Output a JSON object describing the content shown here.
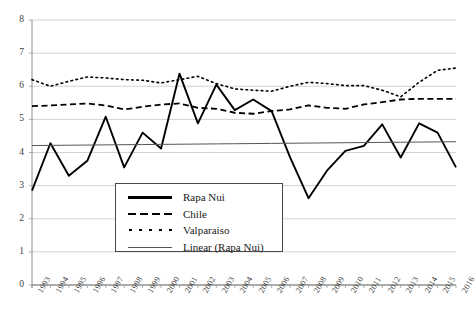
{
  "chart_data": {
    "type": "line",
    "title": "",
    "xlabel": "",
    "ylabel": "",
    "ylim": [
      0,
      8
    ],
    "ytick_step": 1,
    "grid": "horizontal",
    "legend_position": "lower-center-left",
    "categories": [
      "1993",
      "1994",
      "1995",
      "1996",
      "1997",
      "1998",
      "1999",
      "2000",
      "2001",
      "2002",
      "2003",
      "2004",
      "2005",
      "2006",
      "2007",
      "2008",
      "2009",
      "2010",
      "2011",
      "2012",
      "2013",
      "2014",
      "2015",
      "2016"
    ],
    "yticks": [
      "0",
      "1",
      "2",
      "3",
      "4",
      "5",
      "6",
      "7",
      "8"
    ],
    "series": [
      {
        "name": "Rapa Nui",
        "style": "solid",
        "color": "#000000",
        "width": 1.9,
        "values": [
          2.85,
          4.28,
          3.3,
          3.75,
          5.08,
          3.55,
          4.6,
          4.12,
          6.38,
          4.88,
          6.05,
          5.28,
          5.6,
          5.25,
          3.85,
          2.62,
          3.45,
          4.05,
          4.2,
          4.85,
          3.85,
          4.88,
          4.6,
          3.55
        ]
      },
      {
        "name": "Chile",
        "style": "dashed",
        "color": "#000000",
        "width": 1.8,
        "values": [
          5.4,
          5.42,
          5.45,
          5.48,
          5.42,
          5.3,
          5.38,
          5.45,
          5.48,
          5.35,
          5.32,
          5.2,
          5.17,
          5.25,
          5.3,
          5.42,
          5.35,
          5.32,
          5.45,
          5.52,
          5.6,
          5.62,
          5.62,
          5.62
        ]
      },
      {
        "name": "Valparaiso",
        "style": "dotted",
        "color": "#000000",
        "width": 1.6,
        "values": [
          6.2,
          6.0,
          6.15,
          6.28,
          6.25,
          6.2,
          6.18,
          6.1,
          6.2,
          6.3,
          6.08,
          5.92,
          5.88,
          5.85,
          6.0,
          6.12,
          6.08,
          6.02,
          6.02,
          5.88,
          5.68,
          6.12,
          6.48,
          6.55
        ]
      },
      {
        "name": "Linear (Rapa Nui)",
        "style": "trendline",
        "color": "#555555",
        "width": 1.0,
        "values": [
          4.21,
          4.215,
          4.22,
          4.225,
          4.23,
          4.235,
          4.24,
          4.245,
          4.25,
          4.255,
          4.26,
          4.265,
          4.27,
          4.275,
          4.28,
          4.285,
          4.29,
          4.295,
          4.3,
          4.305,
          4.31,
          4.315,
          4.32,
          4.325
        ]
      }
    ]
  },
  "legend": {
    "items": [
      {
        "label": "Rapa Nui",
        "style": "solid"
      },
      {
        "label": "Chile",
        "style": "dashed"
      },
      {
        "label": "Valparaiso",
        "style": "dotted"
      },
      {
        "label": "Linear (Rapa Nui)",
        "style": "thin"
      }
    ]
  },
  "caption": ""
}
